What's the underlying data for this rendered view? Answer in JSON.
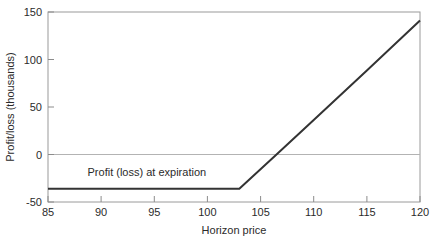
{
  "chart_data": {
    "type": "line",
    "title": "",
    "subtitle": "",
    "xlabel": "Horizon price",
    "ylabel": "Profit/loss (thousands)",
    "xlim": [
      85,
      120
    ],
    "ylim": [
      -50,
      150
    ],
    "xticks": [
      85,
      90,
      95,
      100,
      105,
      110,
      115,
      120
    ],
    "yticks": [
      -50,
      0,
      50,
      100,
      150
    ],
    "xtick_labels": [
      "85",
      "90",
      "95",
      "100",
      "105",
      "110",
      "115",
      "120"
    ],
    "ytick_labels": [
      "-50",
      "0",
      "50",
      "100",
      "150"
    ],
    "grid": false,
    "legend": "none",
    "zero_reference_line": {
      "value": 0,
      "color": "#b3b3b3",
      "orientation": "horizontal"
    },
    "annotations": [
      {
        "text": "Profit (loss) at expiration",
        "x": 94.3,
        "y": -23,
        "color": "#2b2b2b"
      }
    ],
    "series": [
      {
        "name": "Profit (loss) at expiration",
        "color": "#333333",
        "line_width": 2,
        "breakeven_x": 106.5,
        "strike_x": 103,
        "max_loss": -36,
        "x": [
          85,
          90,
          95,
          100,
          103,
          106.5,
          110,
          115,
          120
        ],
        "values": [
          -36,
          -36,
          -36,
          -36,
          -36,
          0,
          36.4,
          88.4,
          141
        ]
      }
    ]
  },
  "axes": {
    "x_tick_labels": [
      "85",
      "90",
      "95",
      "100",
      "105",
      "110",
      "115",
      "120"
    ],
    "y_tick_labels": [
      "-50",
      "0",
      "50",
      "100",
      "150"
    ],
    "x_title": "Horizon price",
    "y_title": "Profit/loss (thousands)"
  },
  "colors": {
    "frame": "#9a9a9a",
    "series": "#333333",
    "zero_line": "#b3b3b3",
    "text": "#2b2b2b",
    "background": "#ffffff"
  }
}
